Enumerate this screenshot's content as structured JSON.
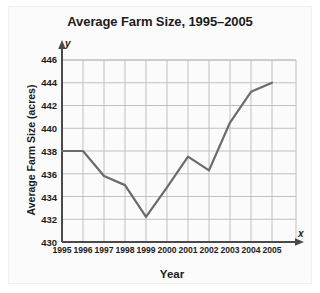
{
  "chart_data": {
    "type": "line",
    "title": "Average Farm Size, 1995–2005",
    "xlabel": "Year",
    "ylabel": "Average Farm Size (acres)",
    "x": [
      1995,
      1996,
      1997,
      1998,
      1999,
      2000,
      2001,
      2002,
      2003,
      2004,
      2005
    ],
    "values": [
      438,
      438,
      435.8,
      435,
      432.2,
      434.8,
      437.5,
      436.3,
      440.5,
      443.2,
      444
    ],
    "series": [
      {
        "name": "Average Farm Size (acres)",
        "values": [
          438,
          438,
          435.8,
          435,
          432.2,
          434.8,
          437.5,
          436.3,
          440.5,
          443.2,
          444
        ]
      }
    ],
    "xlim": [
      1995,
      2005
    ],
    "ylim": [
      430,
      446
    ],
    "x_tick_labels": [
      "1995",
      "1996",
      "1997",
      "1998",
      "1999",
      "2000",
      "2001",
      "2002",
      "2003",
      "2004",
      "2005"
    ],
    "y_tick_labels": [
      "430",
      "432",
      "434",
      "436",
      "438",
      "440",
      "442",
      "444",
      "446"
    ],
    "y_ticks": [
      430,
      432,
      434,
      436,
      438,
      440,
      442,
      444,
      446
    ],
    "y_tick_step": 2,
    "grid": true,
    "legend": null,
    "legend_position": "none",
    "axis_letters": {
      "x": "x",
      "y": "y"
    },
    "colors": {
      "line": "#6b6b6b",
      "grid": "#b9b9b9",
      "axis": "#4a4a4a",
      "text": "#1c1c1c",
      "background": "#ffffff"
    }
  }
}
